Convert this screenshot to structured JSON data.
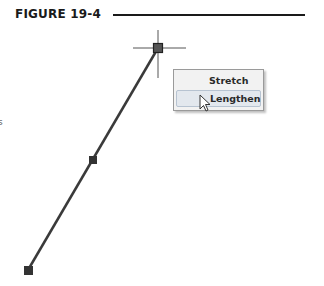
{
  "figure": {
    "label": "FIGURE 19-4"
  },
  "context_menu": {
    "items": [
      {
        "label": "Stretch",
        "highlighted": false
      },
      {
        "label": "Lengthen",
        "highlighted": true
      }
    ]
  },
  "drawing": {
    "line": {
      "start": [
        158,
        48
      ],
      "end": [
        28,
        270
      ],
      "color": "#3a3a3a"
    },
    "grips": [
      {
        "name": "endpoint-top",
        "x": 158,
        "y": 48,
        "active": true
      },
      {
        "name": "midpoint",
        "x": 93,
        "y": 160,
        "active": false
      },
      {
        "name": "endpoint-bottom",
        "x": 28,
        "y": 270,
        "active": false
      }
    ],
    "crosshair": {
      "x": 158,
      "y": 48
    }
  },
  "edge_fragment": "s"
}
